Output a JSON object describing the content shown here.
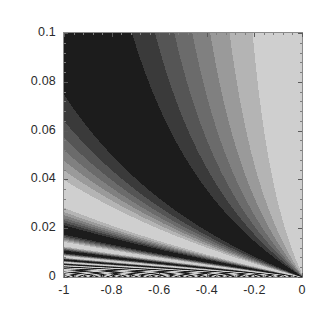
{
  "chart_data": {
    "type": "heatmap",
    "title": "",
    "subtitle": "",
    "xlabel": "",
    "ylabel": "",
    "xlim": [
      -1,
      0
    ],
    "ylim": [
      0,
      0.1
    ],
    "grid": false,
    "legend": "none",
    "colormap": "grayscale",
    "colormap_levels": [
      "#1c1c1c",
      "#3a3a3a",
      "#555555",
      "#6b6b6b",
      "#808080",
      "#9a9a9a",
      "#b4b4b4",
      "#cfcfcf"
    ],
    "background": "#808080",
    "frame_color": "#8a8a8a",
    "field": {
      "expression": "cos(phase)",
      "phase_numerator_coefficient": 0.145,
      "phase_offset": 1.9,
      "x_shift": 0.0085,
      "y_shift": 0.00035,
      "levels": 8
    },
    "x_ticks": [
      {
        "value": -1,
        "label": "-1"
      },
      {
        "value": -0.8,
        "label": "-0.8"
      },
      {
        "value": -0.6,
        "label": "-0.6"
      },
      {
        "value": -0.4,
        "label": "-0.4"
      },
      {
        "value": -0.2,
        "label": "-0.2"
      },
      {
        "value": 0,
        "label": "0"
      }
    ],
    "x_minor_tick_count": 4,
    "y_ticks": [
      {
        "value": 0,
        "label": "0"
      },
      {
        "value": 0.02,
        "label": "0.02"
      },
      {
        "value": 0.04,
        "label": "0.04"
      },
      {
        "value": 0.06,
        "label": "0.06"
      },
      {
        "value": 0.08,
        "label": "0.08"
      },
      {
        "value": 0.1,
        "label": "0.1"
      }
    ],
    "y_minor_tick_count": 4
  }
}
